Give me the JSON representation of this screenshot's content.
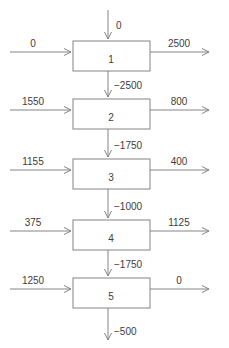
{
  "diagram": {
    "type": "cascade-flow-diagram",
    "colors": {
      "line": "#848484",
      "text": "#3d3d3d",
      "background": "#ffffff"
    },
    "top_input": {
      "label": "0"
    },
    "stages": [
      {
        "id": "1",
        "left_in": "0",
        "right_out": "2500",
        "down_out": "−2500"
      },
      {
        "id": "2",
        "left_in": "1550",
        "right_out": "800",
        "down_out": "−1750"
      },
      {
        "id": "3",
        "left_in": "1155",
        "right_out": "400",
        "down_out": "−1000"
      },
      {
        "id": "4",
        "left_in": "375",
        "right_out": "1125",
        "down_out": "−1750"
      },
      {
        "id": "5",
        "left_in": "1250",
        "right_out": "0",
        "down_out": "−500"
      }
    ]
  }
}
